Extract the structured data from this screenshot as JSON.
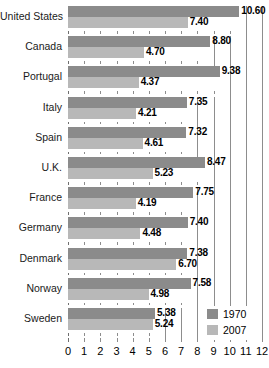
{
  "chart_data": {
    "type": "bar",
    "orientation": "horizontal",
    "title": "",
    "subtitle": "",
    "xlabel": "",
    "ylabel": "",
    "xlim": [
      0,
      12
    ],
    "grid": true,
    "legend_position": "bottom-right",
    "categories": [
      "United States",
      "Canada",
      "Portugal",
      "Italy",
      "Spain",
      "U.K.",
      "France",
      "Germany",
      "Denmark",
      "Norway",
      "Sweden"
    ],
    "series": [
      {
        "name": "1970",
        "color": "#8b8b8b",
        "values": [
          10.6,
          8.8,
          9.38,
          7.35,
          7.32,
          8.47,
          7.75,
          7.4,
          7.38,
          7.58,
          5.38
        ],
        "labels": [
          "10.60",
          "8.80",
          "9.38",
          "7.35",
          "7.32",
          "8.47",
          "7.75",
          "7.40",
          "7.38",
          "7.58",
          "5.38"
        ]
      },
      {
        "name": "2007",
        "color": "#b8b8b8",
        "values": [
          7.4,
          4.7,
          4.37,
          4.21,
          4.61,
          5.23,
          4.19,
          4.48,
          6.7,
          4.98,
          5.24
        ],
        "labels": [
          "7.40",
          "4.70",
          "4.37",
          "4.21",
          "4.61",
          "5.23",
          "4.19",
          "4.48",
          "6.70",
          "4.98",
          "5.24"
        ]
      }
    ],
    "xticks": [
      0,
      1,
      2,
      3,
      4,
      5,
      6,
      7,
      8,
      9,
      10,
      11,
      12
    ],
    "xticklabels": [
      "0",
      "1",
      "2",
      "3",
      "4",
      "5",
      "6",
      "7",
      "8",
      "9",
      "10",
      "11",
      "12"
    ]
  },
  "legend": {
    "items": [
      {
        "label": "1970",
        "color": "#8b8b8b"
      },
      {
        "label": "2007",
        "color": "#b8b8b8"
      }
    ]
  }
}
